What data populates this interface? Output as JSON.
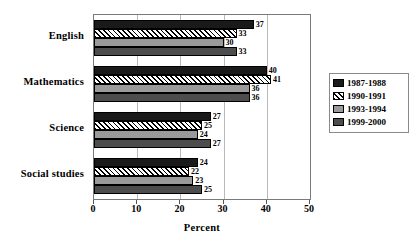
{
  "chart_data": {
    "type": "bar",
    "orientation": "horizontal",
    "title": "",
    "xlabel": "Percent",
    "ylabel": "",
    "xlim": [
      0,
      50
    ],
    "xticks": [
      0,
      10,
      20,
      30,
      40,
      50
    ],
    "grid": true,
    "legend_position": "right",
    "categories": [
      "English",
      "Mathematics",
      "Science",
      "Social studies"
    ],
    "series": [
      {
        "name": "1987-1988",
        "color": "#1a1a1a",
        "pattern": "solid-dark",
        "values": [
          37,
          40,
          27,
          24
        ]
      },
      {
        "name": "1990-1991",
        "color": "#ffffff",
        "pattern": "diagonal-hatch",
        "values": [
          33,
          41,
          25,
          22
        ]
      },
      {
        "name": "1993-1994",
        "color": "#9a9a9a",
        "pattern": "solid-light-gray",
        "values": [
          30,
          36,
          24,
          23
        ]
      },
      {
        "name": "1999-2000",
        "color": "#4d4d4d",
        "pattern": "solid-dark-gray",
        "values": [
          33,
          36,
          27,
          25
        ]
      }
    ]
  },
  "axis": {
    "x_title": "Percent",
    "tick_labels": [
      "0",
      "10",
      "20",
      "30",
      "40",
      "50"
    ]
  },
  "legend": {
    "items": [
      {
        "label": "1987-1988"
      },
      {
        "label": "1990-1991"
      },
      {
        "label": "1993-1994"
      },
      {
        "label": "1999-2000"
      }
    ]
  }
}
